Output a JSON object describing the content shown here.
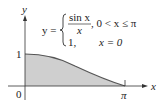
{
  "diagram": {
    "y_axis_label": "y",
    "x_axis_label": "x",
    "origin_label": "0",
    "y_tick_label": "1",
    "x_tick_label": "π",
    "equation": {
      "lhs": "y =",
      "case1_numerator": "sin x",
      "case1_denominator": "x",
      "case1_condition": ", 0 < x ≤ π",
      "case2_value": "1,",
      "case2_condition": "x = 0"
    },
    "curve": "sin(x)/x on [0, π], area under curve shaded",
    "fill_color": "#cfcfcf",
    "curve_color": "#555555"
  }
}
